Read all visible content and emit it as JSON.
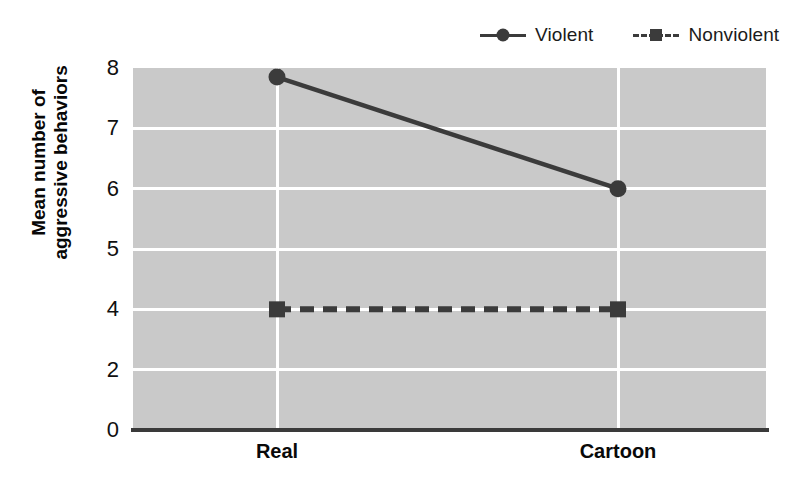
{
  "chart_data": {
    "type": "line",
    "title": "",
    "subtitle": "",
    "xlabel": "",
    "ylabel": "Mean number of aggressive behaviors",
    "ylabel_line1": "Mean number of",
    "ylabel_line2": "aggressive behaviors",
    "categories": [
      "Real",
      "Cartoon"
    ],
    "y_tick_labels": [
      "8",
      "7",
      "6",
      "5",
      "4",
      "2",
      "0"
    ],
    "y_tick_values": [
      8,
      7,
      6,
      5,
      4,
      2,
      0
    ],
    "ylim": [
      0,
      8
    ],
    "grid": "horizontal-and-vertical",
    "grid_color": "#ffffff",
    "plot_background": "#c9c9c9",
    "legend_position": "top-right",
    "series": [
      {
        "name": "Violent",
        "values": [
          7.85,
          6.0
        ],
        "marker": "circle",
        "line_style": "solid",
        "color": "#3b3b3b"
      },
      {
        "name": "Nonviolent",
        "values": [
          4.0,
          4.0
        ],
        "marker": "square",
        "line_style": "dashed",
        "color": "#3b3b3b"
      }
    ]
  },
  "legend": {
    "entries": [
      {
        "label": "Violent",
        "marker": "circle-marker",
        "line": "solid-line"
      },
      {
        "label": "Nonviolent",
        "marker": "square-marker",
        "line": "dashed-line"
      }
    ]
  },
  "axes": {
    "y_ticks": [
      "8",
      "7",
      "6",
      "5",
      "4",
      "2",
      "0"
    ],
    "x_ticks": [
      "Real",
      "Cartoon"
    ]
  },
  "colors": {
    "series": "#3b3b3b",
    "plot_bg": "#c9c9c9",
    "grid": "#ffffff",
    "axis": "#3a3a3a",
    "text": "#101010"
  }
}
